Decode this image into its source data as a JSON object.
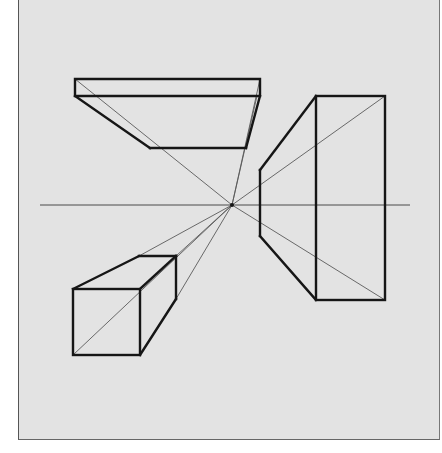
{
  "figure": {
    "background_color": "#e3e3e3",
    "line_color": "#161616",
    "vanishing_point": {
      "x": 232,
      "y": 205
    },
    "horizon": {
      "y": 205,
      "x1": 40,
      "x2": 410
    },
    "shapes": [
      {
        "name": "overhead-slab",
        "description": "flat slab above horizon, left"
      },
      {
        "name": "right-box",
        "description": "tall box to the right of vanishing point"
      },
      {
        "name": "lower-left-cube",
        "description": "cube below horizon, left"
      }
    ]
  }
}
